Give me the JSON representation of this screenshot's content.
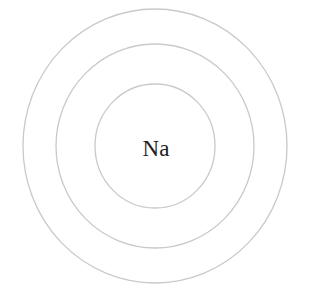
{
  "diagram": {
    "type": "atomic-shell-diagram",
    "element_symbol": "Na",
    "shell_count": 3,
    "center": {
      "x": 155,
      "y": 146
    },
    "shells": [
      {
        "name": "inner-shell",
        "rx": 60,
        "ry": 62
      },
      {
        "name": "middle-shell",
        "rx": 99,
        "ry": 102
      },
      {
        "name": "outer-shell",
        "rx": 132,
        "ry": 137
      }
    ],
    "colors": {
      "background": "#ffffff",
      "shell_stroke": "#c9c9c9",
      "label": "#222222"
    }
  }
}
